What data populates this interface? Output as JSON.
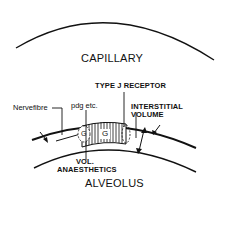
{
  "diagram": {
    "labels": {
      "capillary": "CAPILLARY",
      "alveolus": "ALVEOLUS",
      "type_j_receptor": "TYPE J RECEPTOR",
      "interstitial_line1": "INTERSTITIAL",
      "interstitial_line2": "VOLUME",
      "nerve_fibre": "Nervefibre",
      "pdg": "pdg etc.",
      "vol_line1": "VOL.",
      "vol_line2": "ANAESTHETICS",
      "g_small": "G",
      "g_large": "G"
    },
    "colors": {
      "stroke": "#111111",
      "background": "#ffffff"
    }
  }
}
